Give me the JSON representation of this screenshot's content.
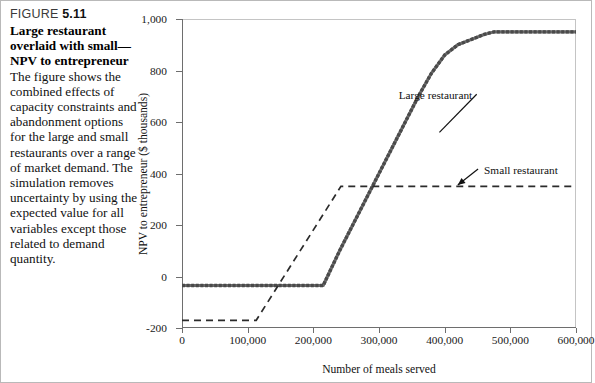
{
  "figure": {
    "label": "FIGURE",
    "number": "5.11",
    "title": "Large restaurant overlaid with small—NPV to entrepreneur",
    "body": "The figure shows the combined effects of capacity constraints and abandonment options for the large and small restaurants over a range of market demand. The simulation removes uncertainty by using the expected value for all variables except those related to demand quantity."
  },
  "chart_data": {
    "type": "line",
    "title": "",
    "xlabel": "Number of meals served",
    "ylabel": "NPV to entrepreneur ($ thousands)",
    "xlim": [
      0,
      600000
    ],
    "ylim": [
      -200,
      1000
    ],
    "xticks": [
      0,
      100000,
      200000,
      300000,
      400000,
      500000,
      600000
    ],
    "xticklabels": [
      "0",
      "100,000",
      "200,000",
      "300,000",
      "400,000",
      "500,000",
      "600,000"
    ],
    "yticks": [
      -200,
      0,
      200,
      400,
      600,
      800,
      1000
    ],
    "yticklabels": [
      "-200",
      "0",
      "200",
      "400",
      "600",
      "800",
      "1,000"
    ],
    "grid": false,
    "legend_position": "inline-annotations",
    "series": [
      {
        "name": "Large restaurant",
        "style": "solid-thick-markers",
        "color": "#6b6b6b",
        "x": [
          0,
          80000,
          100000,
          120000,
          140000,
          160000,
          180000,
          200000,
          215000,
          240000,
          260000,
          280000,
          300000,
          320000,
          340000,
          360000,
          380000,
          400000,
          420000,
          440000,
          460000,
          475000,
          520000,
          560000,
          600000
        ],
        "y": [
          -35,
          -35,
          -35,
          -35,
          -35,
          -35,
          -35,
          -35,
          -35,
          100,
          200,
          300,
          400,
          500,
          600,
          700,
          790,
          860,
          900,
          920,
          940,
          950,
          950,
          950,
          950
        ]
      },
      {
        "name": "Small restaurant",
        "style": "dashed",
        "color": "#2b2b2b",
        "x": [
          0,
          113000,
          242000,
          600000
        ],
        "y": [
          -170,
          -170,
          350,
          350
        ]
      }
    ],
    "annotations": [
      {
        "text": "Large restaurant",
        "x": 330000,
        "y": 700,
        "arrow_to_x": 392000,
        "arrow_to_y": 560
      },
      {
        "text": "Small restaurant",
        "x": 460000,
        "y": 410,
        "arrow_to_x": 420000,
        "arrow_to_y": 355
      }
    ]
  }
}
